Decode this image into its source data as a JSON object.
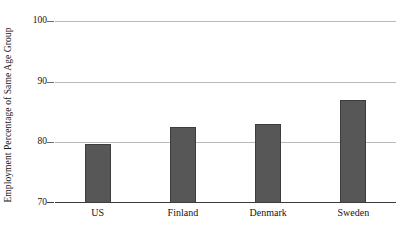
{
  "chart_data": {
    "type": "bar",
    "title": "",
    "xlabel": "",
    "ylabel": "Employment Percentage of Same Age Group",
    "categories": [
      "US",
      "Finland",
      "Denmark",
      "Sweden"
    ],
    "values": [
      79.8,
      82.6,
      83.1,
      87.0
    ],
    "ylim": [
      70,
      100
    ],
    "yticks": [
      70,
      80,
      90,
      100
    ],
    "ytick_labels": [
      "70",
      "80",
      "90",
      "100"
    ],
    "grid": true,
    "legend": null,
    "series": [
      {
        "name": "Employment Percentage of Same Age Group",
        "values": [
          79.8,
          82.6,
          83.1,
          87.0
        ]
      }
    ],
    "colors": {
      "bar_fill": "#575757",
      "bar_edge": "#3d3d3d",
      "gridline": "#b9b9b9",
      "axis_line": "#3b3b3b",
      "background": "#ffffff",
      "text": "#141414"
    }
  }
}
